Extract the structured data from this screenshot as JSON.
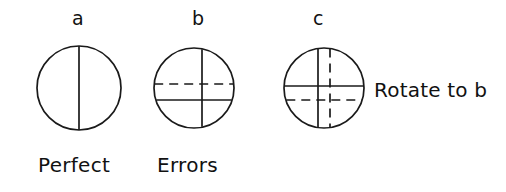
{
  "figure": {
    "background_color": "#ffffff",
    "ink_color": "#1a1a1a",
    "panel_labels": {
      "a": "a",
      "b": "b",
      "c": "c"
    },
    "captions": {
      "perfect": "Perfect",
      "errors": "Errors"
    },
    "side_note": "Rotate to b",
    "panels": [
      {
        "id": "a",
        "label": "a",
        "caption": "Perfect",
        "center_x": 79,
        "center_y": 88,
        "radius": 42,
        "lines": [
          {
            "name": "vertical-diameter",
            "orientation": "vertical",
            "style": "solid",
            "offset": 0
          }
        ]
      },
      {
        "id": "b",
        "label": "b",
        "caption": "Errors",
        "center_x": 194,
        "center_y": 88,
        "radius": 40,
        "lines": [
          {
            "name": "vertical-diameter",
            "orientation": "vertical",
            "style": "solid",
            "offset": 8
          },
          {
            "name": "horizontal-dashed-reference",
            "orientation": "horizontal",
            "style": "dashed",
            "offset": -4
          },
          {
            "name": "horizontal-solid-offset",
            "orientation": "horizontal",
            "style": "solid",
            "offset": 12
          }
        ]
      },
      {
        "id": "c",
        "label": "c",
        "caption": "",
        "center_x": 324,
        "center_y": 88,
        "radius": 40,
        "lines": [
          {
            "name": "vertical-solid-offset",
            "orientation": "vertical",
            "style": "solid",
            "offset": -6
          },
          {
            "name": "vertical-dashed-reference",
            "orientation": "vertical",
            "style": "dashed",
            "offset": 6
          },
          {
            "name": "horizontal-solid-offset",
            "orientation": "horizontal",
            "style": "solid",
            "offset": -2
          },
          {
            "name": "horizontal-dashed-reference",
            "orientation": "horizontal",
            "style": "dashed",
            "offset": 12
          }
        ]
      }
    ]
  }
}
